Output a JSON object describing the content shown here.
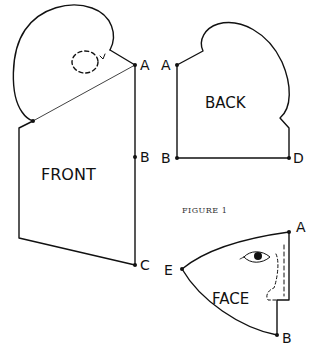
{
  "figure": {
    "caption": "FIGURE 1",
    "pieces": {
      "front": {
        "label": "FRONT",
        "points": {
          "A": "A",
          "B": "B",
          "C": "C"
        }
      },
      "back": {
        "label": "BACK",
        "points": {
          "A": "A",
          "B": "B",
          "D": "D"
        }
      },
      "face": {
        "label": "FACE",
        "points": {
          "A": "A",
          "B": "B",
          "E": "E"
        }
      }
    },
    "colors": {
      "line": "#111111",
      "background": "#ffffff"
    }
  }
}
